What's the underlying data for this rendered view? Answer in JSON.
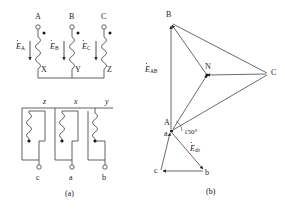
{
  "figure": {
    "captions": {
      "a": "(a)",
      "b": "(b)"
    },
    "colors": {
      "line": "#3a3a3a",
      "text": "#1a1a1a",
      "background": "#ffffff"
    }
  },
  "circuit": {
    "primary": {
      "terminals": [
        {
          "name": "A",
          "label": "A",
          "x": 38,
          "y": 27
        },
        {
          "name": "B",
          "label": "B",
          "x": 72,
          "y": 27
        },
        {
          "name": "C",
          "label": "C",
          "x": 104,
          "y": 27
        }
      ],
      "bottom_terminals": [
        {
          "name": "X",
          "label": "X",
          "x": 41,
          "y": 70
        },
        {
          "name": "Y",
          "label": "Y",
          "x": 75,
          "y": 70
        },
        {
          "name": "Z",
          "label": "Z",
          "x": 107,
          "y": 70
        }
      ],
      "emf_labels": [
        {
          "name": "E_A",
          "symbol": "E",
          "subscript": "A",
          "x": 24,
          "y": 48
        },
        {
          "name": "E_B",
          "symbol": "E",
          "subscript": "B",
          "x": 57,
          "y": 48
        },
        {
          "name": "E_C",
          "symbol": "E",
          "subscript": "C",
          "x": 89,
          "y": 48
        }
      ],
      "polarity_dots": [
        {
          "x": 44,
          "y": 33
        },
        {
          "x": 78,
          "y": 33
        },
        {
          "x": 110,
          "y": 33
        }
      ]
    },
    "secondary": {
      "winding_labels": [
        {
          "name": "z",
          "label": "z",
          "x": 45,
          "y": 102
        },
        {
          "name": "x",
          "label": "x",
          "x": 76,
          "y": 102
        },
        {
          "name": "y",
          "label": "y",
          "x": 107,
          "y": 102
        }
      ],
      "terminals": [
        {
          "name": "c",
          "label": "c",
          "x": 39,
          "y": 167
        },
        {
          "name": "a",
          "label": "a",
          "x": 72,
          "y": 167
        },
        {
          "name": "b",
          "label": "b",
          "x": 105,
          "y": 167
        }
      ],
      "polarity_dots": [
        {
          "x": 29,
          "y": 141
        },
        {
          "x": 62,
          "y": 141
        },
        {
          "x": 95,
          "y": 141
        }
      ]
    }
  },
  "phasor": {
    "vertices": [
      {
        "name": "B",
        "label": "B",
        "x": 172,
        "y": 23
      },
      {
        "name": "C",
        "label": "C",
        "x": 268,
        "y": 74
      },
      {
        "name": "N",
        "label": "N",
        "x": 207,
        "y": 75
      },
      {
        "name": "A",
        "label": "A",
        "x": 171,
        "y": 131
      },
      {
        "name": "a",
        "label": "a",
        "x": 171,
        "y": 131
      },
      {
        "name": "c",
        "label": "c",
        "x": 160,
        "y": 172
      },
      {
        "name": "b",
        "label": "b",
        "x": 204,
        "y": 172
      }
    ],
    "vector_labels": [
      {
        "name": "E_AB",
        "symbol": "E",
        "subscript": "AB",
        "x": 150,
        "y": 70
      },
      {
        "name": "E_ab",
        "symbol": "E",
        "subscript": "ab",
        "x": 192,
        "y": 150
      }
    ],
    "angle": {
      "name": "angle-150",
      "label": "150°",
      "x": 184,
      "y": 134
    }
  }
}
